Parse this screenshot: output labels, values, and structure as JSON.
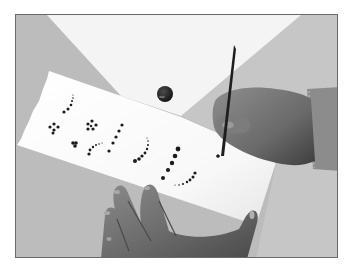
{
  "image": {
    "description": "Grayscale photo of hands painting dot patterns with a fine brush on a strip of white paper lying on a gray table",
    "alt_text": "Hands painting dot patterns on paper with a brush",
    "colors": {
      "table": "#bcbcbc",
      "table_right": "#c6c6c6",
      "back_sheet": "#f4f4f4",
      "paper": "#fbfbfb",
      "ink": "#1c1c1c",
      "skin": "#7a7a7a",
      "skin_shadow": "#4a4a4a",
      "sleeve": "#8c8c8c",
      "frame": "#6a6a6a"
    },
    "dot_patterns": [
      {
        "name": "arc-1",
        "dots": [
          [
            63,
            111,
            1.6
          ],
          [
            67,
            108,
            1.5
          ],
          [
            70,
            104,
            1.3
          ],
          [
            71,
            100,
            1.0
          ],
          [
            72,
            97,
            0.8
          ],
          [
            72,
            94,
            0.6
          ]
        ]
      },
      {
        "name": "cluster-1",
        "dots": [
          [
            49,
            126,
            1.6
          ],
          [
            53,
            123,
            1.6
          ],
          [
            57,
            126,
            1.6
          ],
          [
            53,
            129,
            1.6
          ],
          [
            52,
            132,
            1.5
          ]
        ]
      },
      {
        "name": "cluster-2",
        "dots": [
          [
            87,
            123,
            1.6
          ],
          [
            91,
            120,
            1.6
          ],
          [
            95,
            124,
            1.6
          ],
          [
            87,
            128,
            1.6
          ],
          [
            92,
            128,
            1.6
          ],
          [
            90,
            125,
            1.2
          ]
        ]
      },
      {
        "name": "heart",
        "dots": [
          [
            72,
            142,
            1.8
          ],
          [
            75,
            142,
            1.8
          ],
          [
            74,
            145,
            1.8
          ]
        ]
      },
      {
        "name": "arc-2",
        "dots": [
          [
            88,
            153,
            1.6
          ],
          [
            89,
            149,
            1.4
          ],
          [
            92,
            146,
            1.2
          ],
          [
            95,
            144,
            1.0
          ],
          [
            98,
            143,
            0.8
          ],
          [
            101,
            142,
            0.6
          ]
        ]
      },
      {
        "name": "diagonal-line",
        "dots": [
          [
            121,
            124,
            1.6
          ],
          [
            118,
            130,
            1.6
          ],
          [
            115,
            136,
            1.6
          ],
          [
            112,
            142,
            1.6
          ],
          [
            108,
            150,
            1.6
          ]
        ]
      },
      {
        "name": "arc-3",
        "dots": [
          [
            134,
            160,
            2.0
          ],
          [
            138,
            158,
            1.8
          ],
          [
            141,
            155,
            1.6
          ],
          [
            144,
            152,
            1.4
          ],
          [
            146,
            148,
            1.2
          ],
          [
            147,
            144,
            1.0
          ],
          [
            147,
            140,
            0.8
          ],
          [
            146,
            137,
            0.6
          ]
        ]
      },
      {
        "name": "big-dot-line",
        "dots": [
          [
            177,
            148,
            2.4
          ],
          [
            174,
            155,
            2.3
          ],
          [
            171,
            162,
            2.2
          ],
          [
            167,
            169,
            2.1
          ],
          [
            162,
            177,
            2.0
          ]
        ]
      },
      {
        "name": "arc-4",
        "dots": [
          [
            194,
            172,
            1.6
          ],
          [
            192,
            176,
            1.5
          ],
          [
            189,
            179,
            1.4
          ],
          [
            186,
            181,
            1.2
          ],
          [
            182,
            183,
            1.0
          ],
          [
            178,
            184,
            0.8
          ],
          [
            174,
            184,
            0.6
          ]
        ]
      },
      {
        "name": "brush-dot",
        "dots": [
          [
            217,
            155,
            1.6
          ]
        ]
      }
    ],
    "paint_drop": {
      "cx": 164,
      "cy": 93,
      "r": 8
    }
  }
}
